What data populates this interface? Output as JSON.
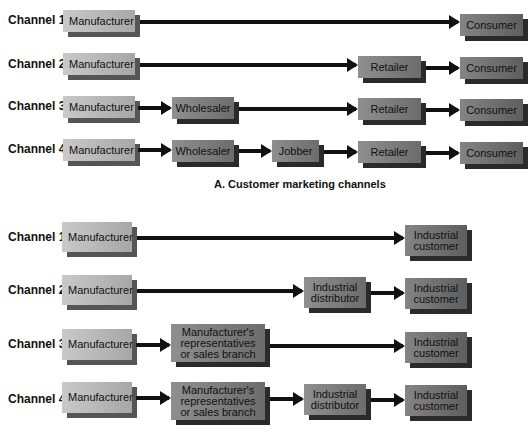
{
  "section_a": {
    "title": "A. Customer marketing channels",
    "rows": [
      {
        "label": "Channel 1",
        "nodes": [
          "Manufacturer",
          "Consumer"
        ]
      },
      {
        "label": "Channel 2",
        "nodes": [
          "Manufacturer",
          "Retailer",
          "Consumer"
        ]
      },
      {
        "label": "Channel 3",
        "nodes": [
          "Manufacturer",
          "Wholesaler",
          "Retailer",
          "Consumer"
        ]
      },
      {
        "label": "Channel 4",
        "nodes": [
          "Manufacturer",
          "Wholesaler",
          "Jobber",
          "Retailer",
          "Consumer"
        ]
      }
    ]
  },
  "section_b": {
    "rows": [
      {
        "label": "Channel 1",
        "nodes": [
          "Manufacturer",
          "Industrial customer"
        ]
      },
      {
        "label": "Channel 2",
        "nodes": [
          "Manufacturer",
          "Industrial distributor",
          "Industrial customer"
        ]
      },
      {
        "label": "Channel 3",
        "nodes": [
          "Manufacturer",
          "Manufacturer's representatives or sales branch",
          "Industrial customer"
        ]
      },
      {
        "label": "Channel 4",
        "nodes": [
          "Manufacturer",
          "Manufacturer's representatives or sales branch",
          "Industrial distributor",
          "Industrial customer"
        ]
      }
    ]
  },
  "colors": {
    "arrow": "#111111",
    "producer_box": "#b8b8b8",
    "intermediary_box": "#7d7d7d",
    "end_box": "#707070",
    "shadow": "#2a2a2a"
  }
}
